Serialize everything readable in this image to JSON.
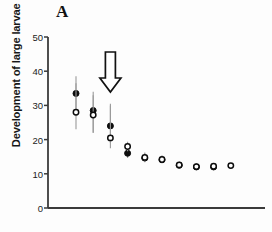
{
  "panel": {
    "label": "A"
  },
  "axes": {
    "y_title": "Development of large larvae (days)",
    "y_ticks": [
      0,
      10,
      20,
      30,
      40,
      50
    ],
    "x_ticks": []
  },
  "annotation": {
    "arrow": {
      "name": "down-arrow",
      "x_index": 2,
      "direction": "down"
    }
  },
  "colors": {
    "axis": "#3b3b3b",
    "marker": "#0d0d0d",
    "errorbar": "#9a9a9a",
    "text": "#171717",
    "background": "#fdfdfd"
  },
  "chart_data": {
    "type": "scatter",
    "title": "A",
    "xlabel": "",
    "ylabel": "Development of large larvae (days)",
    "ylim": [
      0,
      50
    ],
    "xlim": [
      0,
      11
    ],
    "grid": false,
    "legend": "none",
    "yticks": [
      0,
      10,
      20,
      30,
      40,
      50
    ],
    "x": [
      1,
      2,
      3,
      4,
      5,
      6,
      7,
      8,
      9,
      10
    ],
    "series": [
      {
        "name": "filled-circle",
        "marker": "filled",
        "values": [
          33.5,
          28.5,
          24.0,
          16.0,
          14.6,
          14.1,
          12.5,
          12.0,
          12.0,
          null
        ],
        "error_low": [
          28.0,
          22.0,
          19.0,
          14.6,
          13.4,
          13.2,
          11.8,
          11.3,
          11.2,
          null
        ],
        "error_high": [
          38.5,
          34.0,
          30.5,
          18.0,
          16.0,
          15.2,
          13.3,
          12.8,
          12.9,
          null
        ]
      },
      {
        "name": "open-circle",
        "marker": "open",
        "values": [
          28.0,
          27.2,
          20.5,
          18.0,
          14.8,
          14.2,
          12.6,
          12.1,
          12.2,
          12.4
        ],
        "error_low": [
          23.0,
          22.0,
          17.5,
          16.6,
          13.6,
          13.3,
          11.9,
          11.4,
          11.4,
          11.8
        ],
        "error_high": [
          36.5,
          33.0,
          30.0,
          19.4,
          16.2,
          15.4,
          13.4,
          12.9,
          13.0,
          13.0
        ]
      }
    ]
  }
}
